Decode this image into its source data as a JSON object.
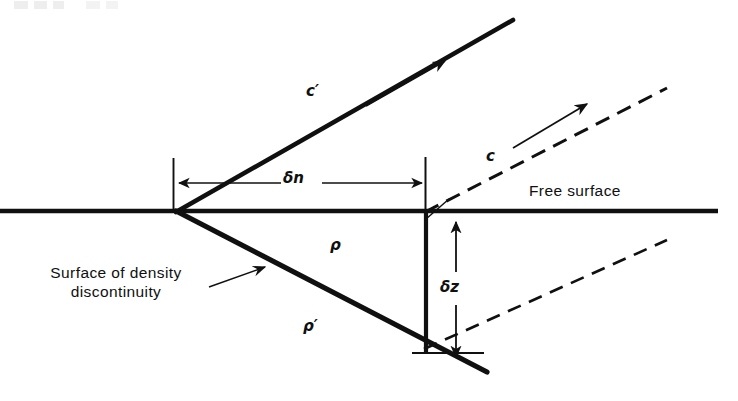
{
  "figure": {
    "kind": "physics-diagram",
    "background_color": "#ffffff",
    "ink_color": "#101010",
    "width": 738,
    "height": 401
  },
  "labels": {
    "c_prime": "c′",
    "c": "c",
    "delta_n": "δn",
    "delta_z": "δz",
    "rho": "ρ",
    "rho_prime": "ρ′",
    "free_surface": "Free surface",
    "surface_of_density_line1": "Surface of density",
    "surface_of_density_line2": "discontinuity"
  },
  "geometry": {
    "vertex": {
      "x": 177,
      "y": 211
    },
    "free_surface_line": {
      "x1": 0,
      "y1": 211,
      "x2": 718,
      "y2": 211,
      "stroke_width": 4.5
    },
    "upper_ray_c_prime": {
      "x1": 177,
      "y1": 211,
      "x2": 513,
      "y2": 20,
      "stroke_width": 4.5,
      "style": "solid"
    },
    "lower_ray_rho_prime": {
      "x1": 177,
      "y1": 211,
      "x2": 486,
      "y2": 371,
      "stroke_width": 5.0,
      "style": "solid"
    },
    "dashed_ray_c": {
      "x1": 425,
      "y1": 211,
      "x2": 666,
      "y2": 89,
      "stroke_width": 3.0,
      "style": "dashed",
      "dash_pattern": "14 9"
    },
    "dashed_ray_lower": {
      "x1": 425,
      "y1": 348,
      "x2": 666,
      "y2": 240,
      "stroke_width": 2.6,
      "style": "dashed",
      "dash_pattern": "13 9"
    },
    "arrow_c_prime": {
      "x1": 367,
      "y1": 105,
      "x2": 444,
      "y2": 62,
      "stroke_width": 1.6
    },
    "arrow_c": {
      "x1": 514,
      "y1": 147,
      "x2": 586,
      "y2": 105,
      "stroke_width": 1.6
    },
    "dimension_delta_n": {
      "y": 183,
      "x_left": 176,
      "x_right": 423,
      "tick_left": {
        "x": 173,
        "y1": 158,
        "y2": 209
      },
      "tick_right": {
        "x": 425,
        "y1": 158,
        "y2": 211
      },
      "stroke_width": 1.6,
      "double_headed": true
    },
    "dimension_delta_z": {
      "x": 456,
      "y_top": 220,
      "y_bottom": 360,
      "stroke_width": 1.6,
      "double_headed": true
    },
    "vertical_drop_line": {
      "x": 426,
      "y1": 211,
      "y2": 352,
      "stroke_width": 4.0
    },
    "bottom_tick": {
      "x1": 413,
      "y1": 353,
      "x2": 483,
      "y2": 353,
      "stroke_width": 1.8
    },
    "leader_surface_density": {
      "x1": 210,
      "y1": 286,
      "x2": 264,
      "y2": 268,
      "stroke_width": 1.4,
      "arrowhead_at": "end"
    },
    "leader_free_surface": {
      "x1": 425,
      "y1": 218,
      "x2": 447,
      "y2": 200,
      "stroke_width": 1.4
    }
  }
}
